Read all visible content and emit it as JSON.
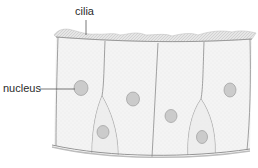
{
  "diagram": {
    "labels": {
      "cilia": "cilia",
      "nucleus": "nucleus"
    },
    "colors": {
      "cell_outline": "#8a8a8a",
      "cell_fill": "#f3f3f3",
      "nucleus_fill": "#c9c9c9",
      "nucleus_stroke": "#9a9a9a",
      "cilia_fill": "#d9d9d9",
      "label_text": "#2a2a2a",
      "leader_line": "#555555"
    }
  }
}
